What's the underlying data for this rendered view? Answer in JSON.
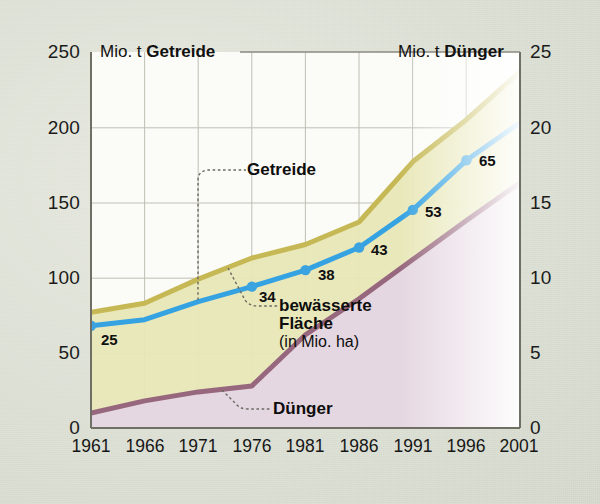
{
  "header": {
    "left_axis_caption_plain": "Mio. t ",
    "left_axis_caption_bold": "Getreide",
    "right_axis_caption_plain": "Mio. t ",
    "right_axis_caption_bold": "Dünger"
  },
  "series_labels": {
    "getreide": "Getreide",
    "bewaesserte_l1": "bewässerte",
    "bewaesserte_l2": "Fläche",
    "bewaesserte_l3": "(in Mio. ha)",
    "duenger": "Dünger"
  },
  "colors": {
    "getreide_line": "#c9bd5b",
    "getreide_fill": "#e6e6b4",
    "duenger_line": "#9a6b80",
    "duenger_fill": "#e3d4e0",
    "bewaesserte_line": "#3aa3e0",
    "background": "#dfe2d6",
    "plot_background": "#fbfbf7",
    "grid": "#b9b9ad",
    "axis_text": "#1b1b1b"
  },
  "chart_data": {
    "type": "area",
    "title": "",
    "subtitle": "",
    "xlabel": "",
    "ylabel": "Mio. t Getreide",
    "y2label": "Mio. t Dünger",
    "grid": true,
    "legend": "inline-callouts",
    "x": [
      1961,
      1966,
      1971,
      1976,
      1981,
      1986,
      1991,
      1996,
      2001
    ],
    "xticklabels": [
      "1961",
      "1966",
      "1971",
      "1976",
      "1981",
      "1986",
      "1991",
      "1996",
      "2001"
    ],
    "xlim": [
      1961,
      2001
    ],
    "ylim": [
      0,
      250
    ],
    "yticks": [
      0,
      50,
      100,
      150,
      200,
      250
    ],
    "yticklabels": [
      "0",
      "50",
      "100",
      "150",
      "200",
      "250"
    ],
    "y2lim": [
      0,
      25
    ],
    "y2ticks": [
      0,
      5,
      10,
      15,
      20,
      25
    ],
    "y2ticklabels": [
      "0",
      "5",
      "10",
      "15",
      "20",
      "25"
    ],
    "series": [
      {
        "name": "Getreide",
        "unit": "Mio. t",
        "axis": "left",
        "kind": "area",
        "values": [
          77,
          83,
          99,
          113,
          122,
          137,
          177,
          205,
          237
        ]
      },
      {
        "name": "Dünger",
        "unit": "Mio. t",
        "axis": "right",
        "kind": "area",
        "values": [
          1.0,
          1.8,
          2.4,
          2.8,
          6.2,
          8.6,
          11.2,
          13.8,
          16.3
        ]
      },
      {
        "name": "bewässerte Fläche",
        "unit": "Mio. ha",
        "axis": "right",
        "kind": "line",
        "values": [
          6.8,
          7.2,
          8.4,
          9.4,
          10.5,
          12.0,
          14.5,
          17.8,
          20.3
        ],
        "point_labels": [
          "25",
          "",
          "",
          "34",
          "38",
          "43",
          "53",
          "65",
          ""
        ],
        "point_label_years": [
          1961,
          1976,
          1981,
          1986,
          1991,
          1996
        ],
        "point_label_values": [
          "25",
          "34",
          "38",
          "43",
          "53",
          "65"
        ]
      }
    ]
  }
}
